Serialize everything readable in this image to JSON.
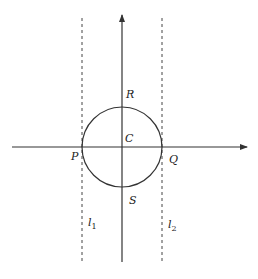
{
  "diagram": {
    "type": "geometry",
    "colors": {
      "stroke": "#333333",
      "background": "#ffffff"
    },
    "labels": {
      "R": "R",
      "C": "C",
      "P": "P",
      "Q": "Q",
      "S": "S",
      "l1_base": "l",
      "l1_sub": "1",
      "l2_base": "l",
      "l2_sub": "2"
    },
    "circle": {
      "center": "C",
      "top": "R",
      "bottom": "S",
      "left": "P",
      "right": "Q"
    },
    "lines": [
      {
        "name": "l1",
        "style": "dashed",
        "through": "P"
      },
      {
        "name": "l2",
        "style": "dashed",
        "through": "Q"
      }
    ]
  }
}
